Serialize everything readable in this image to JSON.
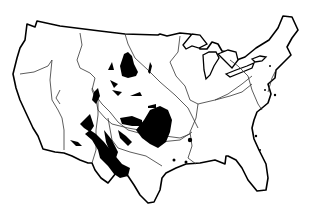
{
  "map": {
    "subject": "Contiguous United States outline with drainage basin boundaries and shaded (black) regions",
    "colors": {
      "background": "#ffffff",
      "outline": "#000000",
      "basin_lines": "#333333",
      "shaded": "#000000"
    },
    "labels": []
  }
}
